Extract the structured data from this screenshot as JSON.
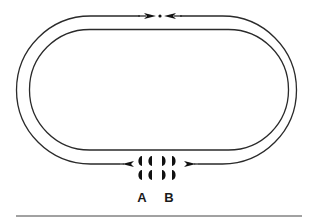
{
  "diagram": {
    "type": "racetrack-loop",
    "colors": {
      "stroke": "#2a2a2a",
      "fill": "#111111",
      "background": "#ffffff"
    },
    "track": {
      "outer": {
        "left": 16,
        "right": 297,
        "top": 16,
        "bottom": 164,
        "corner_radius": 74
      },
      "inner": {
        "left": 29,
        "right": 289,
        "top": 29,
        "bottom": 150,
        "corner_radius": 60
      }
    },
    "top_marker": {
      "dot": {
        "x": 160,
        "y": 16
      },
      "arrows": [
        "converging-right",
        "converging-left"
      ]
    },
    "bottom_marker": {
      "arrows": [
        "diverging-left",
        "diverging-right"
      ]
    },
    "groups": [
      {
        "id": "A",
        "label": "A",
        "orientation": "left-facing-half-discs",
        "count": 4
      },
      {
        "id": "B",
        "label": "B",
        "orientation": "right-facing-half-discs",
        "count": 4
      }
    ]
  }
}
